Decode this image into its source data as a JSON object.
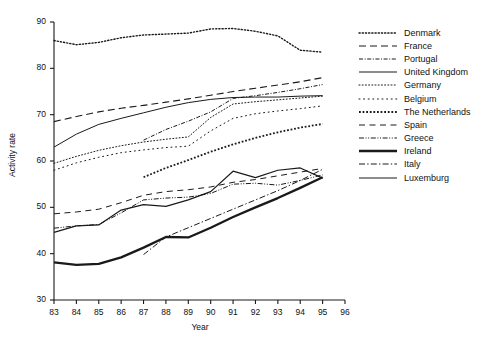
{
  "chart_data": {
    "type": "line",
    "title": "",
    "xlabel": "Year",
    "ylabel": "Activity rate",
    "xlim": [
      83,
      96
    ],
    "ylim": [
      30,
      90
    ],
    "xticks": [
      "83",
      "84",
      "85",
      "86",
      "87",
      "88",
      "89",
      "90",
      "91",
      "92",
      "93",
      "94",
      "95",
      "96"
    ],
    "yticks": [
      "30",
      "40",
      "50",
      "60",
      "70",
      "80",
      "90"
    ],
    "grid": false,
    "legend_position": "right",
    "x": [
      83,
      84,
      85,
      86,
      87,
      88,
      89,
      90,
      91,
      92,
      93,
      94,
      95
    ],
    "series": [
      {
        "name": "Denmark",
        "style": "fine-dotted",
        "width": 1.4,
        "x": [
          83,
          84,
          85,
          86,
          87,
          88,
          89,
          90,
          91,
          92,
          93,
          94,
          95
        ],
        "values": [
          86.0,
          85.1,
          85.6,
          86.6,
          87.2,
          87.4,
          87.6,
          88.5,
          88.6,
          88.0,
          87.0,
          83.9,
          83.5
        ]
      },
      {
        "name": "France",
        "style": "long-dash",
        "width": 1.1,
        "x": [
          83,
          84,
          85,
          86,
          87,
          88,
          89,
          90,
          91,
          92,
          93,
          94,
          95
        ],
        "values": [
          68.5,
          69.6,
          70.6,
          71.4,
          72.0,
          72.7,
          73.4,
          74.2,
          75.0,
          75.7,
          76.4,
          77.1,
          78.0
        ]
      },
      {
        "name": "Portugal",
        "style": "dash-dot-fine",
        "width": 1.0,
        "x": [
          87,
          88,
          89,
          90,
          91,
          92,
          93,
          94,
          95
        ],
        "values": [
          64.5,
          66.8,
          68.6,
          70.6,
          73.5,
          74.1,
          74.8,
          75.6,
          76.5
        ]
      },
      {
        "name": "United Kingdom",
        "style": "solid-thin",
        "width": 1.0,
        "x": [
          83,
          84,
          85,
          86,
          87,
          88,
          89,
          90,
          91,
          92,
          93,
          94,
          95
        ],
        "values": [
          63.0,
          65.8,
          67.9,
          69.2,
          70.4,
          71.6,
          72.6,
          73.3,
          73.7,
          73.8,
          73.8,
          74.0,
          74.1
        ]
      },
      {
        "name": "Germany",
        "style": "dotted-fine",
        "width": 1.0,
        "x": [
          83,
          84,
          85,
          86,
          87,
          88,
          89,
          90,
          91,
          92,
          93,
          94,
          95
        ],
        "values": [
          59.5,
          61.0,
          62.3,
          63.3,
          64.1,
          64.7,
          65.2,
          69.4,
          72.3,
          72.8,
          73.2,
          73.6,
          74.0
        ]
      },
      {
        "name": "Belgium",
        "style": "sparse-dotted",
        "width": 1.0,
        "x": [
          83,
          84,
          85,
          86,
          87,
          88,
          89,
          90,
          91,
          92,
          93,
          94,
          95
        ],
        "values": [
          58.0,
          59.6,
          60.8,
          61.8,
          62.4,
          62.9,
          63.2,
          66.5,
          69.2,
          70.2,
          70.8,
          71.3,
          71.9
        ]
      },
      {
        "name": "The Netherlands",
        "style": "bold-dotted",
        "width": 1.8,
        "x": [
          87,
          88,
          89,
          90,
          91,
          92,
          93,
          94,
          95
        ],
        "values": [
          56.5,
          58.5,
          60.2,
          62.0,
          63.6,
          65.0,
          66.2,
          67.2,
          68.0
        ]
      },
      {
        "name": "Spain",
        "style": "medium-dash",
        "width": 1.0,
        "x": [
          83,
          84,
          85,
          86,
          87,
          88,
          89,
          90,
          91,
          92,
          93,
          94,
          95
        ],
        "values": [
          48.6,
          49.0,
          49.6,
          51.0,
          52.6,
          53.4,
          53.8,
          54.4,
          55.4,
          56.0,
          56.8,
          57.6,
          58.4
        ]
      },
      {
        "name": "Greece",
        "style": "dash-dot-dot",
        "width": 1.0,
        "x": [
          83,
          84,
          85,
          86,
          87,
          88,
          89,
          90,
          91,
          92,
          93,
          94,
          95
        ],
        "values": [
          45.5,
          46.0,
          46.3,
          48.8,
          51.6,
          52.0,
          52.2,
          53.0,
          55.0,
          55.2,
          54.8,
          55.8,
          57.0
        ]
      },
      {
        "name": "Ireland",
        "style": "bold-solid",
        "width": 2.3,
        "x": [
          83,
          84,
          85,
          86,
          87,
          88,
          89,
          90,
          91,
          92,
          93,
          94,
          95
        ],
        "values": [
          38.1,
          37.6,
          37.8,
          39.2,
          41.3,
          43.6,
          43.5,
          45.6,
          47.9,
          50.0,
          52.0,
          54.2,
          56.5
        ]
      },
      {
        "name": "Italy",
        "style": "dash-dot-light",
        "width": 1.0,
        "x": [
          87,
          88,
          89,
          90,
          91,
          92,
          93,
          94,
          95
        ],
        "values": [
          39.8,
          43.6,
          45.6,
          47.6,
          49.6,
          51.6,
          53.6,
          55.8,
          58.2
        ]
      },
      {
        "name": "Luxemburg",
        "style": "solid-medium",
        "width": 1.2,
        "x": [
          83,
          84,
          85,
          86,
          87,
          88,
          89,
          90,
          91,
          92,
          93,
          94,
          95
        ],
        "values": [
          44.6,
          46.0,
          46.2,
          49.4,
          50.6,
          50.2,
          51.6,
          53.4,
          57.8,
          56.4,
          58.0,
          58.5,
          56.3
        ]
      }
    ]
  },
  "legend": {
    "items": [
      {
        "label": "Denmark"
      },
      {
        "label": "France"
      },
      {
        "label": "Portugal"
      },
      {
        "label": "United Kingdom"
      },
      {
        "label": "Germany"
      },
      {
        "label": "Belgium"
      },
      {
        "label": "The Netherlands"
      },
      {
        "label": "Spain"
      },
      {
        "label": "Greece"
      },
      {
        "label": "Ireland"
      },
      {
        "label": "Italy"
      },
      {
        "label": "Luxemburg"
      }
    ]
  },
  "colors": {
    "axis": "#1a1a1a",
    "line": "#1a1a1a",
    "background": "#ffffff"
  }
}
